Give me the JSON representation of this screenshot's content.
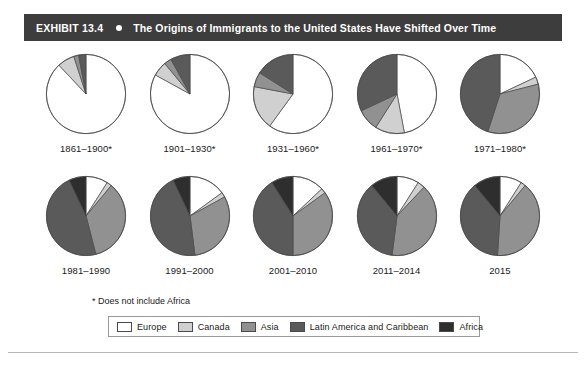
{
  "header": {
    "exhibit_label": "EXHIBIT 13.4",
    "bullet_icon": "bullet-dot",
    "title": "The Origins of Immigrants to the United States Have Shifted Over Time",
    "bar_color": "#3d3d3d",
    "text_color": "#ffffff"
  },
  "footnote": "* Does not include Africa",
  "legend": {
    "items": [
      {
        "label": "Europe",
        "color": "#ffffff"
      },
      {
        "label": "Canada",
        "color": "#d0d0d0"
      },
      {
        "label": "Asia",
        "color": "#919191"
      },
      {
        "label": "Latin America and Caribbean",
        "color": "#5a5a5a"
      },
      {
        "label": "Africa",
        "color": "#2e2e2e"
      }
    ],
    "border_color": "#9a9a9a"
  },
  "chart_data": {
    "type": "pie",
    "title": "The Origins of Immigrants to the United States Have Shifted Over Time",
    "legend_position": "bottom",
    "note": "* Does not include Africa",
    "categories": [
      "Europe",
      "Canada",
      "Asia",
      "Latin America and Caribbean",
      "Africa"
    ],
    "colors": [
      "#ffffff",
      "#d0d0d0",
      "#919191",
      "#5a5a5a",
      "#2e2e2e"
    ],
    "unit": "percent",
    "charts": [
      {
        "title": "1861–1900*",
        "values": [
          88.0,
          7.0,
          2.0,
          3.0,
          0.0
        ]
      },
      {
        "title": "1901–1930*",
        "values": [
          83.0,
          6.0,
          3.0,
          8.0,
          0.0
        ]
      },
      {
        "title": "1931–1960*",
        "values": [
          60.0,
          18.0,
          6.0,
          16.0,
          0.0
        ]
      },
      {
        "title": "1961–1970*",
        "values": [
          47.0,
          12.0,
          9.0,
          32.0,
          0.0
        ]
      },
      {
        "title": "1971–1980*",
        "values": [
          18.0,
          3.0,
          34.0,
          45.0,
          0.0
        ]
      },
      {
        "title": "1981–1990",
        "values": [
          9.0,
          2.0,
          35.0,
          47.0,
          7.0
        ]
      },
      {
        "title": "1991–2000",
        "values": [
          15.0,
          2.0,
          31.0,
          45.0,
          7.0
        ]
      },
      {
        "title": "2001–2010",
        "values": [
          13.0,
          2.0,
          35.0,
          41.0,
          9.0
        ]
      },
      {
        "title": "2011–2014",
        "values": [
          9.0,
          3.0,
          40.0,
          37.0,
          11.0
        ]
      },
      {
        "title": "2015",
        "values": [
          9.0,
          2.0,
          40.0,
          38.0,
          11.0
        ]
      }
    ]
  }
}
